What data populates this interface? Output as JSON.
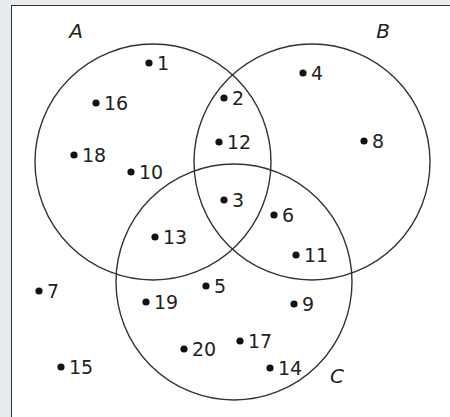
{
  "diagram": {
    "type": "venn-3-set",
    "universal_set_frame": true,
    "colors": {
      "stroke": "#333333",
      "dot": "#111111",
      "text": "#222222",
      "background": "#ffffff",
      "outside": "#e6ecee"
    },
    "sets": [
      {
        "name": "A",
        "label_pos": [
          76,
          38
        ],
        "circle": {
          "cx": 153,
          "cy": 162,
          "r": 118
        }
      },
      {
        "name": "B",
        "label_pos": [
          383,
          38
        ],
        "circle": {
          "cx": 312,
          "cy": 162,
          "r": 118
        }
      },
      {
        "name": "C",
        "label_pos": [
          337,
          383
        ],
        "circle": {
          "cx": 234,
          "cy": 282,
          "r": 118
        }
      }
    ],
    "elements": [
      {
        "value": "1",
        "region": "A only",
        "dot": [
          149,
          63
        ]
      },
      {
        "value": "16",
        "region": "A only",
        "dot": [
          96,
          103
        ]
      },
      {
        "value": "18",
        "region": "A only",
        "dot": [
          74,
          155
        ]
      },
      {
        "value": "10",
        "region": "A only",
        "dot": [
          131,
          172
        ]
      },
      {
        "value": "2",
        "region": "A∩B only",
        "dot": [
          224,
          98
        ]
      },
      {
        "value": "12",
        "region": "A∩B only",
        "dot": [
          219,
          142
        ]
      },
      {
        "value": "4",
        "region": "B only",
        "dot": [
          303,
          73
        ]
      },
      {
        "value": "8",
        "region": "B only",
        "dot": [
          364,
          141
        ]
      },
      {
        "value": "3",
        "region": "A∩B∩C",
        "dot": [
          224,
          200
        ]
      },
      {
        "value": "13",
        "region": "A∩C only",
        "dot": [
          155,
          237
        ]
      },
      {
        "value": "6",
        "region": "B∩C only",
        "dot": [
          274,
          215
        ]
      },
      {
        "value": "11",
        "region": "B∩C only",
        "dot": [
          296,
          255
        ]
      },
      {
        "value": "5",
        "region": "C only",
        "dot": [
          206,
          286
        ]
      },
      {
        "value": "19",
        "region": "C only",
        "dot": [
          146,
          302
        ]
      },
      {
        "value": "9",
        "region": "C only",
        "dot": [
          294,
          304
        ]
      },
      {
        "value": "20",
        "region": "C only",
        "dot": [
          184,
          349
        ]
      },
      {
        "value": "17",
        "region": "C only",
        "dot": [
          240,
          341
        ]
      },
      {
        "value": "14",
        "region": "C only",
        "dot": [
          270,
          368
        ]
      },
      {
        "value": "7",
        "region": "outside",
        "dot": [
          39,
          291
        ]
      },
      {
        "value": "15",
        "region": "outside",
        "dot": [
          61,
          367
        ]
      }
    ]
  }
}
